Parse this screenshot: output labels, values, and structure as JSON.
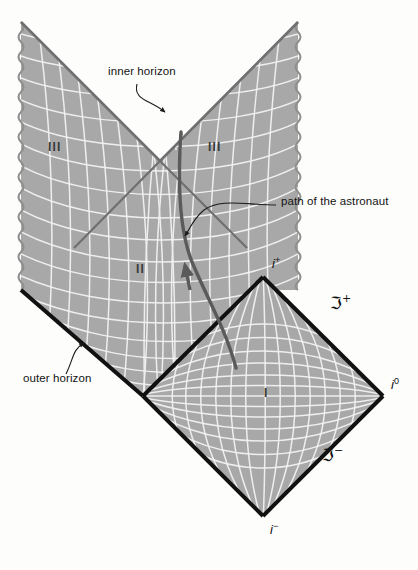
{
  "figure": {
    "kind": "penrose-conformal-diagram",
    "background_color": "#fdfdfc"
  },
  "colors": {
    "shaded_region": "#a8a8a8",
    "grid_line": "#f2f2f2",
    "horizon_line": "#111111",
    "singularity_line": "#8f8f8f",
    "astronaut_path": "#5a5a5a",
    "callout_line": "#1a1a1a",
    "text": "#141414"
  },
  "callouts": [
    {
      "id": "inner-horizon",
      "text": "inner horizon",
      "x": 108,
      "y": 72
    },
    {
      "id": "path-of-the-astronaut",
      "text": "path of the astronaut",
      "x": 281,
      "y": 201
    },
    {
      "id": "outer-horizon",
      "text": "outer horizon",
      "x": 23,
      "y": 378
    }
  ],
  "regions": [
    {
      "id": "region-III-left",
      "label": "III",
      "x": 48,
      "y": 146
    },
    {
      "id": "region-III-right",
      "label": "III",
      "x": 208,
      "y": 146
    },
    {
      "id": "region-II",
      "label": "II",
      "x": 136,
      "y": 268
    },
    {
      "id": "region-I",
      "label": "I",
      "x": 264,
      "y": 392
    }
  ],
  "infinities": [
    {
      "id": "future-timelike-infinity",
      "base": "i",
      "sup": "+",
      "x": 272,
      "y": 262
    },
    {
      "id": "spatial-infinity",
      "base": "i",
      "sup": "0",
      "x": 391,
      "y": 383
    },
    {
      "id": "past-timelike-infinity",
      "base": "i",
      "sup": "−",
      "x": 270,
      "y": 528
    }
  ],
  "null_infinities": [
    {
      "id": "future-null-infinity",
      "base": "ℑ",
      "sup": "+",
      "x": 330,
      "y": 300
    },
    {
      "id": "past-null-infinity",
      "base": "ℑ",
      "sup": "−",
      "x": 322,
      "y": 452
    }
  ],
  "geometry": {
    "apex_left": {
      "x": 21,
      "y": 22
    },
    "apex_right": {
      "x": 298,
      "y": 22
    },
    "horizon_crossing": {
      "x": 160,
      "y": 150
    },
    "i_plus": {
      "x": 263,
      "y": 277
    },
    "i_zero": {
      "x": 383,
      "y": 396
    },
    "i_minus": {
      "x": 263,
      "y": 516
    },
    "bifurcation_left": {
      "x": 143,
      "y": 396
    },
    "singularity_left_x": 21,
    "singularity_right_x": 298,
    "singularity_bottom_y": 290
  }
}
